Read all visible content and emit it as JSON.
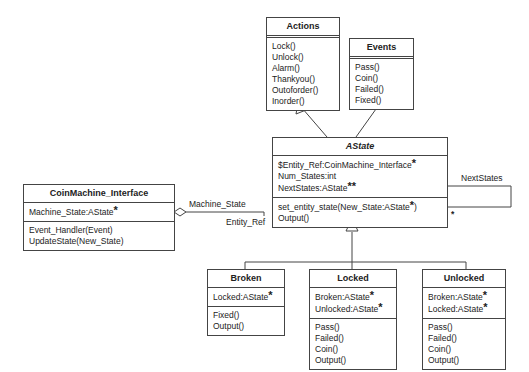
{
  "diagram": {
    "type": "UML class diagram",
    "classes": {
      "actions": {
        "name": "Actions",
        "attributes": [],
        "methods": [
          "Lock()",
          "Unlock()",
          "Alarm()",
          "Thankyou()",
          "Outoforder()",
          "Inorder()"
        ]
      },
      "events": {
        "name": "Events",
        "attributes": [],
        "methods": [
          "Pass()",
          "Coin()",
          "Failed()",
          "Fixed()"
        ]
      },
      "astate": {
        "name": "AState",
        "attributes": [
          {
            "text": "$Entity_Ref:CoinMachine_Interface",
            "mark": "*"
          },
          {
            "text": "Num_States:int",
            "mark": ""
          },
          {
            "text": "NextStates:AState",
            "mark": "**"
          }
        ],
        "methods": [
          {
            "text": "set_entity_state(New_State:AState",
            "mark": "*",
            "suffix": ")"
          },
          {
            "text": "Output()",
            "mark": "",
            "suffix": ""
          }
        ]
      },
      "coinmachine": {
        "name": "CoinMachine_Interface",
        "attributes": [
          {
            "text": "Machine_State:AState",
            "mark": "*"
          }
        ],
        "methods": [
          "Event_Handler(Event)",
          "UpdateState(New_State)"
        ]
      },
      "broken": {
        "name": "Broken",
        "attributes": [
          {
            "text": "Locked:AState",
            "mark": "*"
          }
        ],
        "methods": [
          "Fixed()",
          "Output()"
        ]
      },
      "locked": {
        "name": "Locked",
        "attributes": [
          {
            "text": "Broken:AState",
            "mark": "*"
          },
          {
            "text": "Unlocked:AState",
            "mark": "*"
          }
        ],
        "methods": [
          "Pass()",
          "Failed()",
          "Coin()",
          "Output()"
        ]
      },
      "unlocked": {
        "name": "Unlocked",
        "attributes": [
          {
            "text": "Broken:AState",
            "mark": "*"
          },
          {
            "text": "Locked:AState",
            "mark": "*"
          }
        ],
        "methods": [
          "Pass()",
          "Failed()",
          "Coin()",
          "Output()"
        ]
      }
    },
    "associations": {
      "machine_state_label": "Machine_State",
      "entity_ref_label": "Entity_Ref",
      "next_states_label": "NextStates",
      "next_states_multiplicity": "*"
    },
    "relationships": [
      {
        "from": "AState",
        "to": "Actions",
        "type": "generalization"
      },
      {
        "from": "AState",
        "to": "Events",
        "type": "generalization"
      },
      {
        "from": "Broken",
        "to": "AState",
        "type": "generalization"
      },
      {
        "from": "Locked",
        "to": "AState",
        "type": "generalization"
      },
      {
        "from": "Unlocked",
        "to": "AState",
        "type": "generalization"
      },
      {
        "from": "CoinMachine_Interface",
        "to": "AState",
        "type": "aggregation"
      },
      {
        "from": "AState",
        "to": "AState",
        "type": "self-association"
      }
    ]
  }
}
